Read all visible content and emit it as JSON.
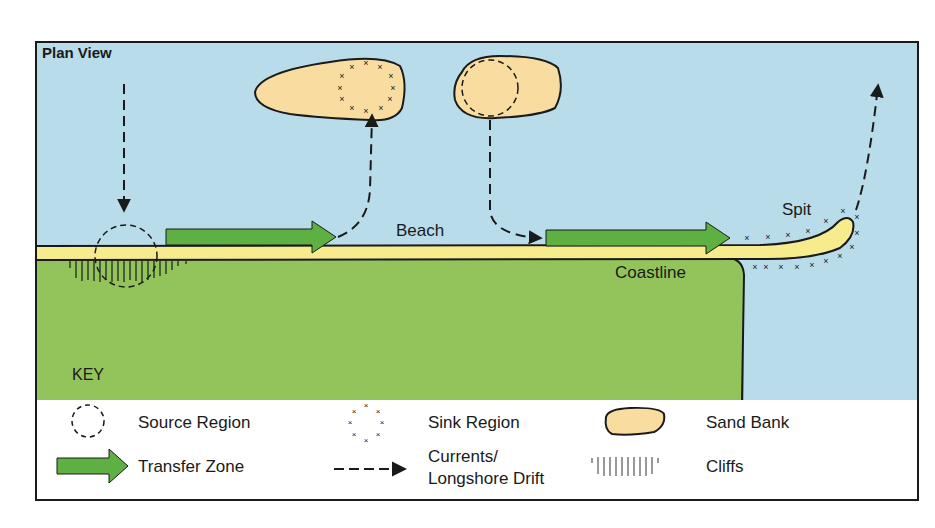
{
  "title": "Plan View",
  "labels": {
    "beach": "Beach",
    "coastline": "Coastline",
    "spit": "Spit"
  },
  "key": {
    "heading": "KEY",
    "items": [
      {
        "icon": "source-region-icon",
        "label": "Source Region"
      },
      {
        "icon": "sink-region-icon",
        "label": "Sink Region"
      },
      {
        "icon": "sand-bank-icon",
        "label": "Sand Bank"
      },
      {
        "icon": "transfer-zone-icon",
        "label": "Transfer Zone"
      },
      {
        "icon": "currents-arrow-icon",
        "label_line1": "Currents/",
        "label_line2": "Longshore Drift"
      },
      {
        "icon": "cliffs-icon",
        "label": "Cliffs"
      }
    ]
  },
  "colors": {
    "sea": "#b9dcea",
    "land": "#93c45c",
    "beach": "#f6ec8e",
    "sand_bank": "#f8dca0",
    "transfer_arrow": "#5fb043",
    "outline": "#1a1a1a",
    "key_bg": "#ffffff"
  }
}
